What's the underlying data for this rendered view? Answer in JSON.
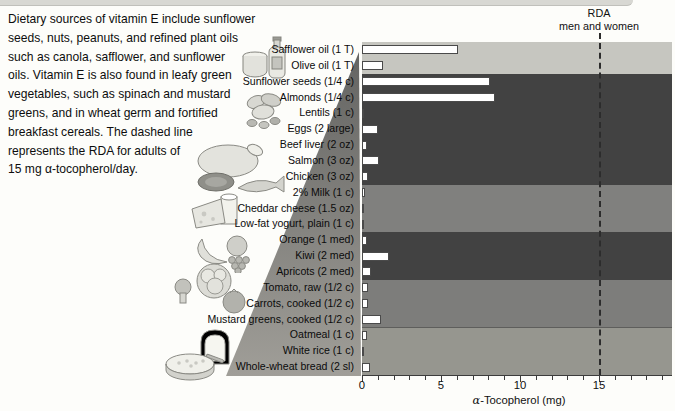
{
  "intro": {
    "lines": [
      "Dietary sources of vitamin E include sunflower",
      "seeds, nuts, peanuts, and refined plant oils",
      "such as canola, safflower, and sunflower",
      "oils. Vitamin E is also found in leafy green",
      "vegetables, such as spinach and mustard",
      "greens, and in wheat germ and fortified",
      "breakfast cereals. The dashed line",
      "represents the RDA for adults of",
      "15 mg α-tocopherol/day."
    ]
  },
  "illustrations": [
    {
      "name": "oil-bottle-jar-icon",
      "depicts": "safflower and olive oil bottle with jar"
    },
    {
      "name": "nuts-seeds-icon",
      "depicts": "peanuts, almonds and seeds"
    },
    {
      "name": "meat-poultry-fish-icon",
      "depicts": "poultry, beef and fish"
    },
    {
      "name": "cheese-milk-icon",
      "depicts": "cheese wedge and glass of milk"
    },
    {
      "name": "fruit-icon",
      "depicts": "banana, apple and grapes"
    },
    {
      "name": "vegetables-icon",
      "depicts": "lettuce, broccoli and tomato"
    },
    {
      "name": "bread-oatmeal-icon",
      "depicts": "bread slice and bowl of oatmeal"
    }
  ],
  "chart_data": {
    "type": "bar",
    "orientation": "horizontal",
    "title": "",
    "xlabel": "α-Tocopherol (mg)",
    "ylabel": "",
    "xlim": [
      0,
      19.6
    ],
    "x_major_ticks": [
      0,
      5,
      10,
      15
    ],
    "x_minor_tick_interval": 1,
    "grid": false,
    "legend": false,
    "rda_line": {
      "value": 15,
      "label_line1": "RDA",
      "label_line2": "men and women",
      "style": "dashed"
    },
    "bar_fill": "#ffffff",
    "bar_border": "#4a4a4a",
    "categories": [
      "Safflower oil (1 T)",
      "Olive oil (1 T)",
      "Sunflower seeds (1/4 c)",
      "Almonds (1/4 c)",
      "Lentils (1 c)",
      "Eggs (2 large)",
      "Beef liver (2 oz)",
      "Salmon (3 oz)",
      "Chicken (3 oz)",
      "2% Milk (1 c)",
      "Cheddar cheese (1.5 oz)",
      "Low-fat yogurt, plain (1 c)",
      "Orange (1 med)",
      "Kiwi (2 med)",
      "Apricots (2 med)",
      "Tomato, raw (1/2 c)",
      "Carrots, cooked (1/2 c)",
      "Mustard greens, cooked (1/2 c)",
      "Oatmeal (1 c)",
      "White rice (1 c)",
      "Whole-wheat bread (2 sl)"
    ],
    "values": [
      6.1,
      1.3,
      8.1,
      8.4,
      0.1,
      1.0,
      0.3,
      1.1,
      0.4,
      0.2,
      0.1,
      0.1,
      0.3,
      1.7,
      0.6,
      0.4,
      0.4,
      1.2,
      0.3,
      0.05,
      0.5
    ],
    "groups": [
      {
        "name": "oils",
        "rows": [
          0,
          1
        ],
        "band_color": "#c6c6c0"
      },
      {
        "name": "seeds-nuts-protein",
        "rows": [
          2,
          8
        ],
        "band_color": "#424242"
      },
      {
        "name": "dairy",
        "rows": [
          9,
          11
        ],
        "band_color": "#80807e"
      },
      {
        "name": "fruits",
        "rows": [
          12,
          14
        ],
        "band_color": "#424242"
      },
      {
        "name": "vegetables",
        "rows": [
          15,
          17
        ],
        "band_color": "#7d7d7b"
      },
      {
        "name": "grains",
        "rows": [
          18,
          20
        ],
        "band_color": "#96968f",
        "separator_top": true
      }
    ]
  }
}
